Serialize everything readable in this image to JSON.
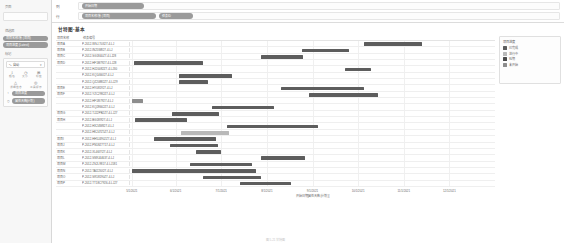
{
  "sidebar": {
    "pages_title": "页面",
    "filters_title": "筛选器",
    "filters": [
      {
        "label": "项目名称/集 (项目)"
      },
      {
        "label": "项目进度 (Latest)"
      }
    ],
    "marks_title": "标记",
    "mark_type": "自动",
    "mark_caret": "▾",
    "mark_buttons": [
      {
        "icon": "↕",
        "name": "color-button",
        "caption": "颜色"
      },
      {
        "icon": "◷",
        "name": "size-button",
        "caption": "大小"
      },
      {
        "icon": "⊞",
        "name": "label-button",
        "caption": "标签"
      },
      {
        "icon": "△",
        "name": "detail-button",
        "caption": "详细信息"
      },
      {
        "icon": "◎",
        "name": "tooltip-button",
        "caption": "工具提示"
      }
    ],
    "mark_pills": [
      {
        "icon": "↕",
        "label": "项目进度"
      },
      {
        "icon": "◷",
        "label": "属性天数(计划)"
      }
    ]
  },
  "shelves": {
    "columns_label": "列",
    "rows_label": "行",
    "columns_pills": [
      {
        "label": "开始日期"
      }
    ],
    "rows_pills": [
      {
        "label": "项目名称/集 (项目)"
      },
      {
        "label": "任务ID"
      }
    ]
  },
  "sheet": {
    "title": "甘特图-基本"
  },
  "legend": {
    "title": "项目进度",
    "items": [
      {
        "label": "已完成",
        "color": "#5d5d5d"
      },
      {
        "label": "进行中",
        "color": "#b9b9b9"
      },
      {
        "label": "延期",
        "color": "#4a4a4a"
      },
      {
        "label": "未开始",
        "color": "#8d8d8d"
      }
    ]
  },
  "table": {
    "header_group": "项目名称",
    "header_id": "任务编号",
    "rows": [
      {
        "group": "项目A",
        "id": "P-2012-WSJ-T0327-4-LJ"
      },
      {
        "group": "项目B",
        "id": "P-2012-IN25W827-4-LJ"
      },
      {
        "group": "项目C",
        "id": "P-2012-SG1840Z7-4-LJ28"
      },
      {
        "group": "项目D",
        "id": "P-2012-HF1M7927-4-LJ28"
      },
      {
        "group": "",
        "id": "P-2012-HJ20082Z7-4-LJ30"
      },
      {
        "group": "",
        "id": "P-2012-KQ1466I27-4-LJ"
      },
      {
        "group": "",
        "id": "P-2012-QZ20882Z7-4-LJ29"
      },
      {
        "group": "项目E",
        "id": "P-2012-HY081927-4-LJ"
      },
      {
        "group": "项目F",
        "id": "P-2012-YZC2982Z7-4-LJ"
      },
      {
        "group": "",
        "id": "P-2012-HF18I7927-4-LJ"
      },
      {
        "group": "",
        "id": "P-2012-KQ28662Z7-4-LJ"
      },
      {
        "group": "项目G",
        "id": "P-2012-TJ22PB2Z7-4-LJ27"
      },
      {
        "group": "项目H",
        "id": "P-2012-BG18I927-4-LJ"
      },
      {
        "group": "",
        "id": "P-2012-HX24W827-4-LJ"
      },
      {
        "group": "",
        "id": "P-2012-HK247Z5Z7-4-LJ"
      },
      {
        "group": "项目I",
        "id": "P-2012-HH5J4902Z7-4-LJ"
      },
      {
        "group": "项目J",
        "id": "P-2012-PN18Z7T17-4-LJ"
      },
      {
        "group": "项目K",
        "id": "P-2012-XL46I7I27-4-LJ"
      },
      {
        "group": "项目L",
        "id": "P-2012-SN9J44637-4-LJ"
      },
      {
        "group": "项目M",
        "id": "P-2012-ZS2L9817-4-LJ181"
      },
      {
        "group": "项目N",
        "id": "P-2012-TAI22I0I27-4-LJ"
      },
      {
        "group": "项目O",
        "id": "P-2012-SR18190Z7-4-LJ"
      },
      {
        "group": "项目P",
        "id": "P-2012-TT18C7926-4-LJ27"
      }
    ]
  },
  "chart_data": {
    "type": "bar",
    "orientation": "horizontal",
    "title": "甘特图-基本",
    "xlabel": "开始日期[属性天数(计划)]",
    "ylabel": "",
    "grid": true,
    "legend_position": "right",
    "x_ticks": [
      "5/1/2021",
      "6/1/2021",
      "7/1/2021",
      "8/1/2021",
      "9/1/2021",
      "10/1/2021",
      "11/1/2021",
      "12/1/2021"
    ],
    "x_tick_positions_pct": [
      0.5,
      12.5,
      25.0,
      37.5,
      50.0,
      62.5,
      75.0,
      87.5
    ],
    "bars": [
      {
        "row": 0,
        "start_pct": 64.0,
        "width_pct": 16.0,
        "color": "#5d5d5d"
      },
      {
        "row": 1,
        "start_pct": 47.0,
        "width_pct": 13.0,
        "color": "#5d5d5d"
      },
      {
        "row": 2,
        "start_pct": 36.0,
        "width_pct": 11.5,
        "color": "#5d5d5d"
      },
      {
        "row": 3,
        "start_pct": 1.0,
        "width_pct": 19.0,
        "color": "#5d5d5d"
      },
      {
        "row": 4,
        "start_pct": 59.0,
        "width_pct": 7.0,
        "color": "#5d5d5d"
      },
      {
        "row": 5,
        "start_pct": 13.5,
        "width_pct": 14.5,
        "color": "#5d5d5d"
      },
      {
        "row": 6,
        "start_pct": 13.5,
        "width_pct": 8.0,
        "color": "#5d5d5d"
      },
      {
        "row": 7,
        "start_pct": 41.5,
        "width_pct": 22.5,
        "color": "#5d5d5d"
      },
      {
        "row": 8,
        "start_pct": 49.0,
        "width_pct": 19.0,
        "color": "#5d5d5d"
      },
      {
        "row": 9,
        "start_pct": 0.5,
        "width_pct": 3.0,
        "color": "#8d8d8d"
      },
      {
        "row": 10,
        "start_pct": 22.5,
        "width_pct": 17.0,
        "color": "#5d5d5d"
      },
      {
        "row": 11,
        "start_pct": 11.5,
        "width_pct": 13.0,
        "color": "#5d5d5d"
      },
      {
        "row": 12,
        "start_pct": 1.5,
        "width_pct": 14.0,
        "color": "#5d5d5d"
      },
      {
        "row": 13,
        "start_pct": 26.5,
        "width_pct": 25.0,
        "color": "#5d5d5d"
      },
      {
        "row": 14,
        "start_pct": 14.0,
        "width_pct": 13.0,
        "color": "#b9b9b9"
      },
      {
        "row": 15,
        "start_pct": 6.5,
        "width_pct": 17.0,
        "color": "#5d5d5d"
      },
      {
        "row": 16,
        "start_pct": 11.0,
        "width_pct": 13.0,
        "color": "#5d5d5d"
      },
      {
        "row": 17,
        "start_pct": 18.0,
        "width_pct": 7.0,
        "color": "#5d5d5d"
      },
      {
        "row": 18,
        "start_pct": 36.0,
        "width_pct": 12.0,
        "color": "#5d5d5d"
      },
      {
        "row": 19,
        "start_pct": 16.5,
        "width_pct": 17.0,
        "color": "#5d5d5d"
      },
      {
        "row": 20,
        "start_pct": 0.5,
        "width_pct": 34.0,
        "color": "#5d5d5d"
      },
      {
        "row": 21,
        "start_pct": 20.0,
        "width_pct": 16.0,
        "color": "#5d5d5d"
      },
      {
        "row": 22,
        "start_pct": 30.0,
        "width_pct": 14.0,
        "color": "#5d5d5d"
      }
    ],
    "reference_lines_pct": [
      13.0,
      33.0
    ]
  },
  "caption": "图 5-21  甘特图"
}
